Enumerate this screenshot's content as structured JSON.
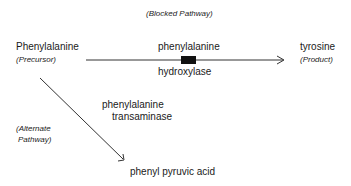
{
  "diagram": {
    "title": "(Blocked Pathway)",
    "nodes": {
      "precursor": {
        "name": "Phenylalanine",
        "role": "(Precursor)"
      },
      "product": {
        "name": "tyrosine",
        "role": "(Product)"
      },
      "alternate_product": {
        "name": "phenyl pyruvic acid"
      }
    },
    "edges": {
      "blocked": {
        "enzyme_line1": "phenylalanine",
        "enzyme_line2": "hydroxylase",
        "status": "blocked"
      },
      "alternate": {
        "enzyme_line1": "phenylalanine",
        "enzyme_line2": "transaminase",
        "label_line1": "(Alternate",
        "label_line2": "Pathway)"
      }
    },
    "colors": {
      "line": "#333333",
      "block": "#111111",
      "text": "#1a1a1a"
    }
  }
}
